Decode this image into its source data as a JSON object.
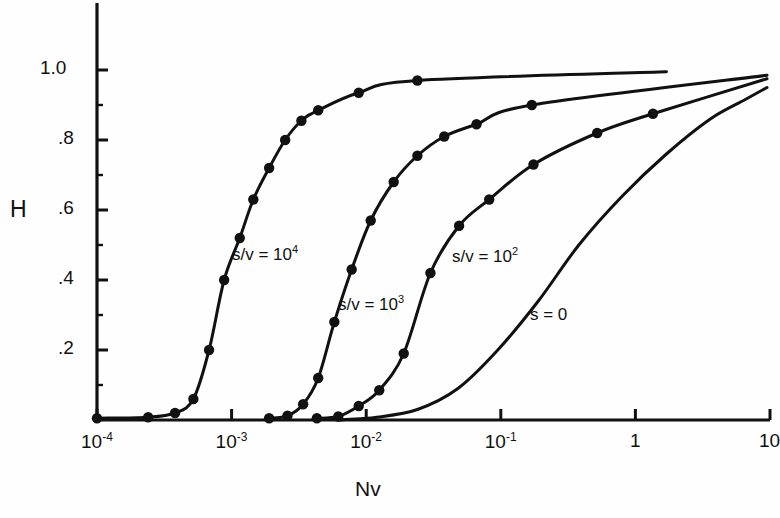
{
  "figure": {
    "background_color": "#fefefe",
    "ink_color": "#111111"
  },
  "axes": {
    "ylabel": "H",
    "xlabel": "Nv",
    "y_ticks": [
      "1.0",
      ".8",
      ".6",
      ".4",
      ".2"
    ],
    "x_ticks": [
      {
        "mantissa": "10",
        "exponent": "-4"
      },
      {
        "mantissa": "10",
        "exponent": "-3"
      },
      {
        "mantissa": "10",
        "exponent": "-2"
      },
      {
        "mantissa": "10",
        "exponent": "-1"
      },
      {
        "mantissa": "1",
        "exponent": ""
      },
      {
        "mantissa": "10",
        "exponent": ""
      }
    ]
  },
  "curve_labels": [
    {
      "text": "s/v = 10",
      "exponent": "4",
      "x": 232,
      "y": 243
    },
    {
      "text": "s/v = 10",
      "exponent": "3",
      "x": 338,
      "y": 293
    },
    {
      "text": "s/v = 10",
      "exponent": "2",
      "x": 452,
      "y": 245
    },
    {
      "text": "s = 0",
      "exponent": "",
      "x": 530,
      "y": 305
    }
  ],
  "chart_data": {
    "type": "line",
    "title": "",
    "xlabel": "Nv",
    "ylabel": "H",
    "xscale": "log",
    "xlim": [
      0.0001,
      10
    ],
    "ylim": [
      0,
      1.05
    ],
    "grid": false,
    "legend": "inline-curve-labels",
    "y_tick_values": [
      1.0,
      0.8,
      0.6,
      0.4,
      0.2
    ],
    "x_tick_values": [
      0.0001,
      0.001,
      0.01,
      0.1,
      1,
      10
    ],
    "series": [
      {
        "name": "s/v = 10^4",
        "label": "s/v = 10⁴",
        "markers": true,
        "points": [
          {
            "x": 0.0001,
            "y": 0.005
          },
          {
            "x": 0.00024,
            "y": 0.008
          },
          {
            "x": 0.00038,
            "y": 0.02
          },
          {
            "x": 0.00052,
            "y": 0.06
          },
          {
            "x": 0.00068,
            "y": 0.2
          },
          {
            "x": 0.00088,
            "y": 0.4
          },
          {
            "x": 0.00115,
            "y": 0.52
          },
          {
            "x": 0.00145,
            "y": 0.63
          },
          {
            "x": 0.0019,
            "y": 0.72
          },
          {
            "x": 0.0025,
            "y": 0.8
          },
          {
            "x": 0.0033,
            "y": 0.855
          },
          {
            "x": 0.0044,
            "y": 0.885
          },
          {
            "x": 0.0088,
            "y": 0.935
          },
          {
            "x": 0.024,
            "y": 0.97
          }
        ],
        "curve_end": {
          "x": 1.7,
          "y": 0.995
        }
      },
      {
        "name": "s/v = 10^3",
        "label": "s/v = 10³",
        "markers": true,
        "points": [
          {
            "x": 0.0019,
            "y": 0.005
          },
          {
            "x": 0.0026,
            "y": 0.012
          },
          {
            "x": 0.0034,
            "y": 0.045
          },
          {
            "x": 0.0044,
            "y": 0.12
          },
          {
            "x": 0.0058,
            "y": 0.28
          },
          {
            "x": 0.0078,
            "y": 0.43
          },
          {
            "x": 0.0108,
            "y": 0.57
          },
          {
            "x": 0.016,
            "y": 0.68
          },
          {
            "x": 0.024,
            "y": 0.755
          },
          {
            "x": 0.038,
            "y": 0.81
          },
          {
            "x": 0.066,
            "y": 0.845
          },
          {
            "x": 0.17,
            "y": 0.9
          }
        ],
        "curve_end": {
          "x": 9.5,
          "y": 0.985
        }
      },
      {
        "name": "s/v = 10^2",
        "label": "s/v = 10²",
        "markers": true,
        "points": [
          {
            "x": 0.0043,
            "y": 0.005
          },
          {
            "x": 0.0062,
            "y": 0.01
          },
          {
            "x": 0.0088,
            "y": 0.04
          },
          {
            "x": 0.0125,
            "y": 0.085
          },
          {
            "x": 0.019,
            "y": 0.19
          },
          {
            "x": 0.03,
            "y": 0.42
          },
          {
            "x": 0.049,
            "y": 0.555
          },
          {
            "x": 0.082,
            "y": 0.63
          },
          {
            "x": 0.175,
            "y": 0.73
          },
          {
            "x": 0.52,
            "y": 0.82
          },
          {
            "x": 1.35,
            "y": 0.875
          }
        ],
        "curve_end": {
          "x": 9.5,
          "y": 0.975
        }
      },
      {
        "name": "s = 0",
        "label": "s = 0",
        "markers": false,
        "points": [
          {
            "x": 0.0062,
            "y": 0.0
          },
          {
            "x": 0.012,
            "y": 0.008
          },
          {
            "x": 0.024,
            "y": 0.03
          },
          {
            "x": 0.048,
            "y": 0.09
          },
          {
            "x": 0.095,
            "y": 0.2
          },
          {
            "x": 0.19,
            "y": 0.34
          },
          {
            "x": 0.38,
            "y": 0.5
          },
          {
            "x": 0.8,
            "y": 0.64
          },
          {
            "x": 1.7,
            "y": 0.76
          },
          {
            "x": 3.6,
            "y": 0.86
          },
          {
            "x": 6.5,
            "y": 0.915
          },
          {
            "x": 9.5,
            "y": 0.95
          }
        ],
        "curve_end": {
          "x": 9.5,
          "y": 0.95
        }
      }
    ]
  }
}
